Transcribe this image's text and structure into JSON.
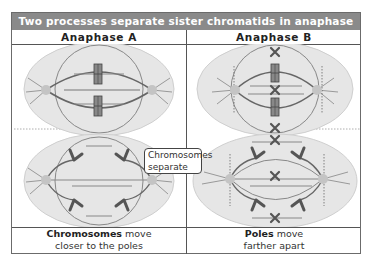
{
  "title": "Two processes separate sister chromatids in anaphase",
  "columns": [
    {
      "heading": "Anaphase A",
      "caption_bold": "Chromosomes",
      "caption_rest_line1": " move",
      "caption_line2": "closer to the poles"
    },
    {
      "heading": "Anaphase B",
      "caption_bold": "Poles",
      "caption_rest_line1": " move",
      "caption_line2": "farther apart"
    }
  ],
  "callout": {
    "line1": "Chromosomes",
    "line2": "separate"
  },
  "colors": {
    "title_bg": "#8a8a8a",
    "cell_fill": "#e6e6e6",
    "cell_stroke": "#c8c8c8",
    "spindle": "#7a7a7a",
    "chromosome": "#555555",
    "pole": "#b0b0b0",
    "border": "#555555"
  },
  "icons": [
    "spindle-cell-icon",
    "chromosome-icon",
    "centrosome-icon",
    "chromatid-x-icon"
  ]
}
